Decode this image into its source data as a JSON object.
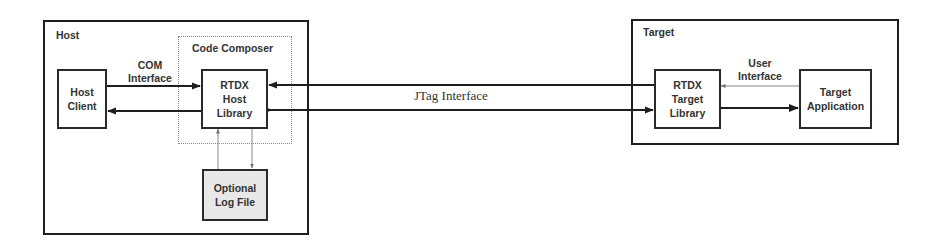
{
  "host": {
    "title": "Host",
    "code_composer": {
      "title": "Code Composer"
    },
    "host_client": {
      "label": "Host\nClient"
    },
    "rtdx_host_library": {
      "label": "RTDX\nHost\nLibrary"
    },
    "log_file": {
      "label": "Optional\nLog File"
    },
    "com_interface": {
      "label": "COM\nInterface"
    }
  },
  "target": {
    "title": "Target",
    "rtdx_target_library": {
      "label": "RTDX\nTarget\nLibrary"
    },
    "target_application": {
      "label": "Target\nApplication"
    },
    "user_interface": {
      "label": "User\nInterface"
    }
  },
  "jtag_interface": {
    "label": "JTag Interface"
  },
  "colors": {
    "stroke": "#1e1e1e",
    "dotted": "#8a8a8a",
    "log_fill": "#e8e8e8"
  }
}
